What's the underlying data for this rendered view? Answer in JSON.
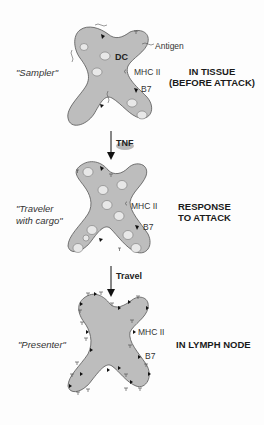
{
  "figure": {
    "stages": [
      {
        "role_label": "\"Sampler\"",
        "location_line1": "IN TISSUE",
        "location_line2": "(BEFORE ATTACK)",
        "labels": {
          "cell": "DC",
          "antigen": "Antigen",
          "mhc": "MHC II",
          "b7": "B7"
        }
      },
      {
        "role_label_line1": "\"Traveler",
        "role_label_line2": "with cargo\"",
        "location_line1": "RESPONSE",
        "location_line2": "TO ATTACK",
        "labels": {
          "mhc": "MHC II",
          "b7": "B7"
        }
      },
      {
        "role_label": "\"Presenter\"",
        "location_line1": "IN LYMPH NODE",
        "labels": {
          "mhc": "MHC II",
          "b7": "B7"
        }
      }
    ],
    "transitions": [
      {
        "label": "TNF"
      },
      {
        "label": "Travel"
      }
    ],
    "colors": {
      "cell_fill": "#bdbdbd",
      "cell_stroke": "#555555",
      "text": "#222222",
      "tnf_blob": "#9a9a9a"
    }
  }
}
